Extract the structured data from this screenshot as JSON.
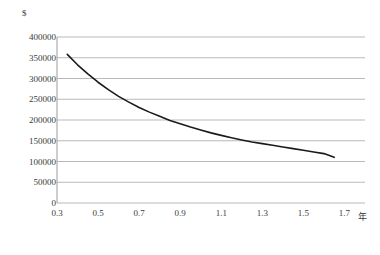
{
  "chart_data": {
    "type": "line",
    "title": "",
    "subtitle": "",
    "xlabel": "年",
    "ylabel": "$",
    "xlim": [
      0.3,
      1.8
    ],
    "ylim": [
      0,
      400000
    ],
    "grid": true,
    "legend": false,
    "legend_position": "none",
    "xticks": [
      "0.3",
      "0.5",
      "0.7",
      "0.9",
      "1.1",
      "1.3",
      "1.5",
      "1.7"
    ],
    "xtick_values": [
      0.3,
      0.5,
      0.7,
      0.9,
      1.1,
      1.3,
      1.5,
      1.7
    ],
    "yticks": [
      "0",
      "50000",
      "100000",
      "150000",
      "200000",
      "250000",
      "300000",
      "350000",
      "400000"
    ],
    "ytick_values": [
      0,
      50000,
      100000,
      150000,
      200000,
      250000,
      300000,
      350000,
      400000
    ],
    "series": [
      {
        "name": "cost-curve",
        "color": "#1a1a1a",
        "x": [
          0.35,
          0.4,
          0.45,
          0.5,
          0.55,
          0.6,
          0.65,
          0.7,
          0.75,
          0.8,
          0.85,
          0.9,
          0.95,
          1.0,
          1.05,
          1.1,
          1.15,
          1.2,
          1.25,
          1.3,
          1.35,
          1.4,
          1.45,
          1.5,
          1.55,
          1.6,
          1.65
        ],
        "values": [
          358000,
          333000,
          311000,
          291000,
          273000,
          257000,
          243000,
          230000,
          219000,
          209000,
          199000,
          191000,
          183000,
          176000,
          169000,
          163000,
          157000,
          152000,
          147000,
          143000,
          139000,
          135000,
          131000,
          127000,
          123000,
          119000,
          110000
        ]
      }
    ],
    "annotations": []
  },
  "axes": {
    "y_title": "$",
    "x_title": "年"
  }
}
